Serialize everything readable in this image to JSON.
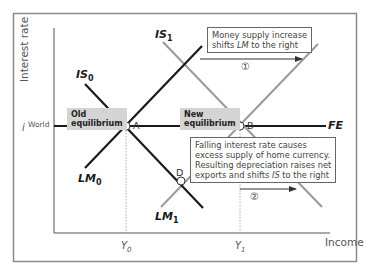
{
  "diagram": {
    "axes": {
      "y_label": "Interest rate",
      "x_label": "Income",
      "i_world_label_i": "i",
      "i_world_label_sup": "World",
      "y0_label": "Y",
      "y0_sub": "0",
      "y1_label": "Y",
      "y1_sub": "1"
    },
    "curves": {
      "is0": {
        "name": "IS",
        "sub": "0",
        "color": "#1a1a1a"
      },
      "is1": {
        "name": "IS",
        "sub": "1",
        "color": "#9a9a9a"
      },
      "lm0": {
        "name": "LM",
        "sub": "0",
        "color": "#1a1a1a"
      },
      "lm1": {
        "name": "LM",
        "sub": "1",
        "color": "#9a9a9a"
      },
      "fe": {
        "name": "FE",
        "color": "#1a1a1a"
      }
    },
    "points": {
      "a": "A",
      "b": "B",
      "d": "D"
    },
    "labels": {
      "old_eq_line1": "Old",
      "old_eq_line2": "equilibrium",
      "new_eq_line1": "New",
      "new_eq_line2": "equilibrium"
    },
    "notes": {
      "step1_pre": "Money supply increase",
      "step1_line2_pre": "shifts ",
      "step1_line2_em": "LM",
      "step1_line2_post": " to the right",
      "step1_marker": "①",
      "step2_line1": "Falling interest rate causes",
      "step2_line2": "excess supply of home currency.",
      "step2_line3": "Resulting depreciation raises net",
      "step2_line4_pre": "exports and shifts ",
      "step2_line4_em": "IS",
      "step2_line4_post": " to the right",
      "step2_marker": "②"
    },
    "colors": {
      "dark_line": "#1a1a1a",
      "shifted_line": "#9a9a9a",
      "frame": "#8a8a8a",
      "eq_box_bg": "#d4d4d4"
    }
  }
}
